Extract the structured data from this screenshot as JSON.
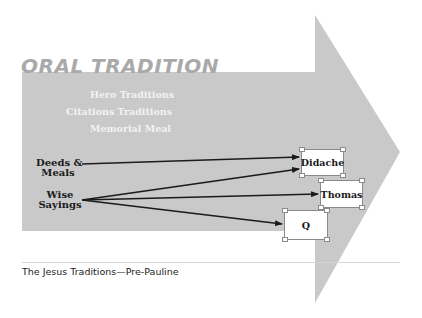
{
  "diagram": {
    "title": "ORAL TRADITION",
    "traditions": [
      {
        "label": "Hero Traditions"
      },
      {
        "label": "Citations Traditions"
      },
      {
        "label": "Memorial Meal"
      }
    ],
    "sources": [
      {
        "line1": "Deeds &",
        "line2": "Meals"
      },
      {
        "line1": "Wise",
        "line2": "Sayings"
      }
    ],
    "documents": [
      {
        "label": "Didache"
      },
      {
        "label": "Thomas"
      },
      {
        "label": "Q"
      }
    ],
    "connections": [
      {
        "from": "Deeds & Meals",
        "to": "Didache"
      },
      {
        "from": "Wise Sayings",
        "to": "Didache"
      },
      {
        "from": "Wise Sayings",
        "to": "Thomas"
      },
      {
        "from": "Wise Sayings",
        "to": "Q"
      }
    ],
    "caption": "The Jesus Traditions—Pre-Pauline",
    "colors": {
      "arrow_fill": "#c9c9c9",
      "title": "#a9a9a9",
      "tradition_text": "#f2f2f2",
      "connector": "#1a1a1a"
    }
  }
}
